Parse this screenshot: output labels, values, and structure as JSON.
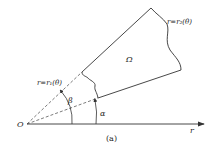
{
  "diagram": {
    "region_label": "Ω",
    "outer_curve_label": "r=r₂(θ)",
    "inner_curve_label": "r=r₁(θ)",
    "angle_beta_label": "β",
    "angle_alpha_label": "α",
    "origin_label": "O",
    "axis_label": "r",
    "caption": "(a)",
    "colors": {
      "stroke": "#333333",
      "background": "#ffffff"
    }
  }
}
